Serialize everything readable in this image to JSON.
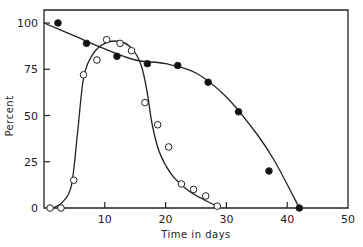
{
  "chart_data": {
    "type": "scatter",
    "title": "",
    "xlabel": "Time in days",
    "ylabel": "Percent",
    "xlim": [
      0,
      50
    ],
    "ylim": [
      0,
      100
    ],
    "x_ticks": [
      10,
      20,
      30,
      40,
      50
    ],
    "y_ticks": [
      0,
      25,
      50,
      75,
      100
    ],
    "grid": false,
    "legend": null,
    "series": [
      {
        "name": "filled circles (declining curve)",
        "marker": "filled-circle",
        "points": [
          [
            2.3,
            100
          ],
          [
            7,
            89
          ],
          [
            12,
            82
          ],
          [
            17,
            78
          ],
          [
            22,
            77
          ],
          [
            27,
            68
          ],
          [
            32,
            52
          ],
          [
            37,
            20
          ],
          [
            42,
            0
          ]
        ],
        "fit_curve": [
          [
            0,
            100
          ],
          [
            5,
            93
          ],
          [
            10,
            86
          ],
          [
            15,
            80
          ],
          [
            20,
            78
          ],
          [
            25,
            73
          ],
          [
            30,
            60
          ],
          [
            35,
            40
          ],
          [
            38,
            25
          ],
          [
            42,
            0
          ]
        ]
      },
      {
        "name": "open circles (rise and fall curve)",
        "marker": "open-circle",
        "points": [
          [
            1,
            0
          ],
          [
            2.8,
            0
          ],
          [
            4.9,
            15
          ],
          [
            6.5,
            72
          ],
          [
            8.7,
            80
          ],
          [
            10.3,
            91
          ],
          [
            12.5,
            89
          ],
          [
            14.4,
            85
          ],
          [
            16.6,
            57
          ],
          [
            18.7,
            45
          ],
          [
            20.5,
            33
          ],
          [
            22.6,
            13
          ],
          [
            24.6,
            10
          ],
          [
            26.6,
            6.5
          ],
          [
            28.5,
            1
          ]
        ],
        "fit_curve": [
          [
            1.5,
            0
          ],
          [
            3,
            3
          ],
          [
            4.5,
            12
          ],
          [
            5.5,
            40
          ],
          [
            6.5,
            70
          ],
          [
            8,
            83
          ],
          [
            10,
            89
          ],
          [
            12.5,
            90
          ],
          [
            14.5,
            86
          ],
          [
            16,
            77
          ],
          [
            17,
            62
          ],
          [
            17.8,
            45
          ],
          [
            19,
            30
          ],
          [
            21,
            18
          ],
          [
            23.5,
            10
          ],
          [
            26,
            5
          ],
          [
            28.5,
            1
          ]
        ]
      }
    ]
  }
}
